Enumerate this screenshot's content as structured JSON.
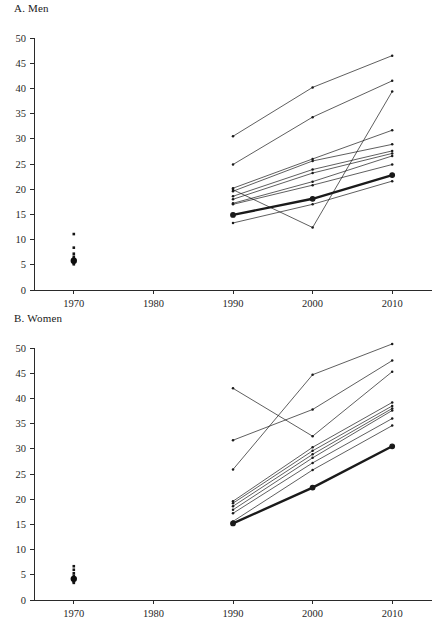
{
  "figure": {
    "width": 436,
    "height": 621
  },
  "panels": [
    {
      "id": "men",
      "title": "A. Men",
      "name": "panel-a-men"
    },
    {
      "id": "women",
      "title": "B. Women",
      "name": "panel-b-women"
    }
  ],
  "axis": {
    "y_ticks": [
      "0",
      "5",
      "10",
      "15",
      "20",
      "25",
      "30",
      "35",
      "40",
      "45",
      "50"
    ],
    "x_ticks": [
      "1970",
      "1980",
      "1990",
      "2000",
      "2010"
    ]
  },
  "chart_data": [
    {
      "type": "line",
      "title": "A. Men",
      "xlabel": "",
      "ylabel": "",
      "x": [
        1970,
        1980,
        1990,
        2000,
        2010
      ],
      "xlim": [
        1965,
        2015
      ],
      "ylim": [
        0,
        50
      ],
      "ytick_values": [
        0,
        5,
        10,
        15,
        20,
        25,
        30,
        35,
        40,
        45,
        50
      ],
      "xtick_values": [
        1970,
        1980,
        1990,
        2000,
        2010
      ],
      "grid": false,
      "legend": "none",
      "scatter_1970": {
        "x": 1970,
        "values": [
          11.1,
          8.4,
          7.2,
          6.6,
          6.2,
          5.9,
          5.6,
          5.3,
          5.1
        ],
        "mean": 5.8
      },
      "series": [
        {
          "name": "line-1",
          "x": [
            1990,
            2000,
            2010
          ],
          "values": [
            30.5,
            40.2,
            46.5
          ],
          "emphasis": false
        },
        {
          "name": "line-2",
          "x": [
            1990,
            2000,
            2010
          ],
          "values": [
            24.9,
            34.3,
            41.5
          ],
          "emphasis": false
        },
        {
          "name": "line-3",
          "x": [
            1990,
            2000,
            2010
          ],
          "values": [
            20.2,
            26.0,
            31.7
          ],
          "emphasis": false
        },
        {
          "name": "line-4",
          "x": [
            1990,
            2000,
            2010
          ],
          "values": [
            19.6,
            25.6,
            28.9
          ],
          "emphasis": false
        },
        {
          "name": "line-5",
          "x": [
            1990,
            2000,
            2010
          ],
          "values": [
            18.6,
            23.9,
            27.6
          ],
          "emphasis": false
        },
        {
          "name": "line-6",
          "x": [
            1990,
            2000,
            2010
          ],
          "values": [
            18.0,
            23.2,
            27.1
          ],
          "emphasis": false
        },
        {
          "name": "line-7",
          "x": [
            1990,
            2000,
            2010
          ],
          "values": [
            17.2,
            21.5,
            26.6
          ],
          "emphasis": false
        },
        {
          "name": "line-8",
          "x": [
            1990,
            2000,
            2010
          ],
          "values": [
            17.0,
            20.8,
            24.9
          ],
          "emphasis": false
        },
        {
          "name": "line-9",
          "x": [
            1990,
            2000,
            2010
          ],
          "values": [
            13.3,
            17.0,
            21.6
          ],
          "emphasis": false
        },
        {
          "name": "line-10",
          "x": [
            1990,
            2000,
            2010
          ],
          "values": [
            19.9,
            12.4,
            39.4
          ],
          "emphasis": false
        },
        {
          "name": "line-total",
          "x": [
            1990,
            2000,
            2010
          ],
          "values": [
            14.9,
            18.1,
            22.8
          ],
          "emphasis": true
        }
      ]
    },
    {
      "type": "line",
      "title": "B. Women",
      "xlabel": "",
      "ylabel": "",
      "x": [
        1970,
        1980,
        1990,
        2000,
        2010
      ],
      "xlim": [
        1965,
        2015
      ],
      "ylim": [
        0,
        50
      ],
      "ytick_values": [
        0,
        5,
        10,
        15,
        20,
        25,
        30,
        35,
        40,
        45,
        50
      ],
      "xtick_values": [
        1970,
        1980,
        1990,
        2000,
        2010
      ],
      "grid": false,
      "legend": "none",
      "scatter_1970": {
        "x": 1970,
        "values": [
          6.7,
          6.0,
          5.3,
          4.8,
          4.5,
          4.2,
          3.9,
          3.6,
          3.4
        ],
        "mean": 4.2
      },
      "series": [
        {
          "name": "line-1",
          "x": [
            1990,
            2000,
            2010
          ],
          "values": [
            25.9,
            44.7,
            50.8
          ],
          "emphasis": false
        },
        {
          "name": "line-2",
          "x": [
            1990,
            2000,
            2010
          ],
          "values": [
            31.7,
            37.8,
            47.5
          ],
          "emphasis": false
        },
        {
          "name": "line-3",
          "x": [
            1990,
            2000,
            2010
          ],
          "values": [
            42.0,
            32.5,
            45.3
          ],
          "emphasis": false
        },
        {
          "name": "line-4",
          "x": [
            1990,
            2000,
            2010
          ],
          "values": [
            19.6,
            30.3,
            39.2
          ],
          "emphasis": false
        },
        {
          "name": "line-5",
          "x": [
            1990,
            2000,
            2010
          ],
          "values": [
            19.2,
            29.6,
            38.5
          ],
          "emphasis": false
        },
        {
          "name": "line-6",
          "x": [
            1990,
            2000,
            2010
          ],
          "values": [
            18.6,
            28.9,
            38.0
          ],
          "emphasis": false
        },
        {
          "name": "line-7",
          "x": [
            1990,
            2000,
            2010
          ],
          "values": [
            17.9,
            28.2,
            37.6
          ],
          "emphasis": false
        },
        {
          "name": "line-8",
          "x": [
            1990,
            2000,
            2010
          ],
          "values": [
            17.2,
            27.2,
            36.0
          ],
          "emphasis": false
        },
        {
          "name": "line-9",
          "x": [
            1990,
            2000,
            2010
          ],
          "values": [
            15.6,
            25.8,
            34.6
          ],
          "emphasis": false
        },
        {
          "name": "line-total",
          "x": [
            1990,
            2000,
            2010
          ],
          "values": [
            15.2,
            22.3,
            30.5
          ],
          "emphasis": true
        }
      ]
    }
  ]
}
